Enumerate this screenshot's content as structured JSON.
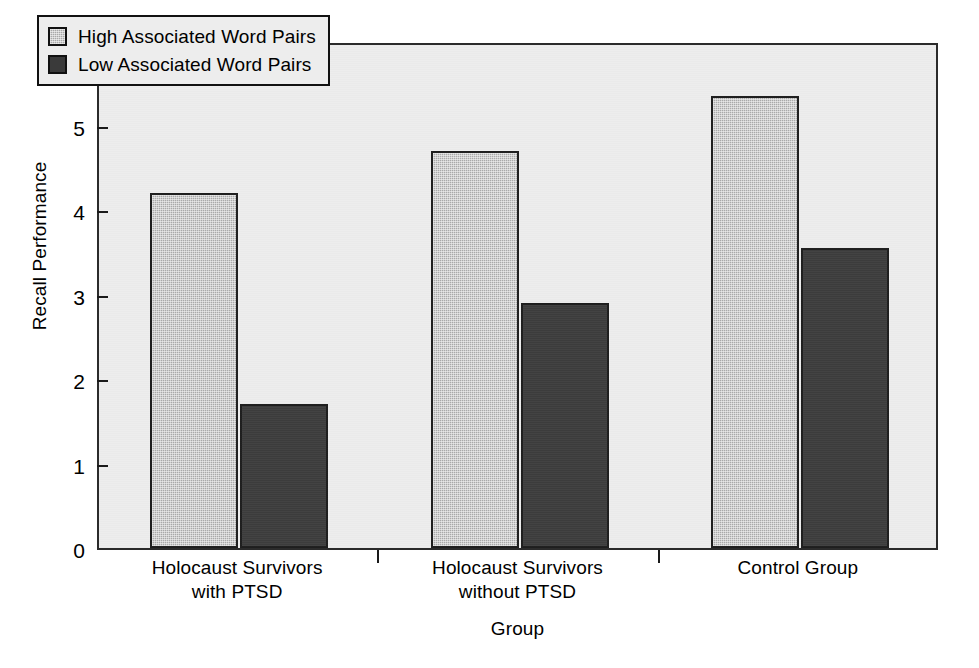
{
  "chart_data": {
    "type": "bar",
    "title": "",
    "subtitle": "",
    "xlabel": "Group",
    "ylabel": "Recall Performance",
    "categories": [
      "Holocaust Survivors\nwith PTSD",
      "Holocaust Survivors\nwithout PTSD",
      "Control Group"
    ],
    "series": [
      {
        "name": "High Associated Word Pairs",
        "values": [
          4.2,
          4.7,
          5.35
        ],
        "color": "#a8a8a8"
      },
      {
        "name": "Low Associated Word Pairs",
        "values": [
          1.7,
          2.9,
          3.55
        ],
        "color": "#3a3a3a"
      }
    ],
    "ylim": [
      0,
      6
    ],
    "yticks": [
      "0",
      "1",
      "2",
      "3",
      "4",
      "5",
      "6"
    ],
    "ytick_values": [
      0,
      1,
      2,
      3,
      4,
      5,
      6
    ],
    "grid": false,
    "legend_position": "upper-left",
    "plot_background": "#ededed",
    "axis_color": "#2b2b2b"
  },
  "legend": {
    "entries": [
      {
        "label": "High Associated Word Pairs"
      },
      {
        "label": "Low Associated Word Pairs"
      }
    ]
  }
}
